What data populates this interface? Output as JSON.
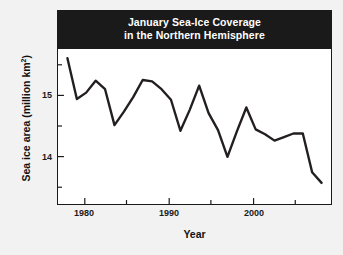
{
  "chart_data": {
    "type": "line",
    "title": "January Sea-Ice Coverage in the Northern Hemisphere",
    "title_line1": "January Sea-Ice Coverage",
    "title_line2": "in the Northern Hemisphere",
    "xlabel": "Year",
    "ylabel": "Sea ice area (million km²)",
    "ylabel_prefix": "Sea ice area (million km",
    "ylabel_sup": "2",
    "ylabel_suffix": ")",
    "grid": false,
    "legend": "none",
    "xlim": [
      1978,
      2007
    ],
    "ylim": [
      13.5,
      15.7
    ],
    "xticks": [
      1980,
      1990,
      2000
    ],
    "xtick_labels": [
      "1980",
      "1990",
      "2000"
    ],
    "xminor_ticks": [
      1985,
      1995,
      2005
    ],
    "yticks": [
      14,
      15
    ],
    "ytick_labels": [
      "14",
      "15"
    ],
    "yminor_ticks": [
      13.5,
      14.5,
      15.5
    ],
    "line_color": "#231f20",
    "line_width": 2.2,
    "x": [
      1979,
      1980,
      1981,
      1982,
      1983,
      1984,
      1985,
      1986,
      1987,
      1988,
      1989,
      1990,
      1991,
      1992,
      1993,
      1994,
      1995,
      1996,
      1997,
      1998,
      1999,
      2000,
      2001,
      2002,
      2003,
      2004,
      2005,
      2006
    ],
    "values": [
      15.57,
      14.99,
      15.08,
      15.25,
      15.13,
      14.62,
      14.81,
      15.02,
      15.26,
      15.24,
      15.13,
      14.98,
      14.54,
      14.84,
      15.18,
      14.79,
      14.55,
      14.17,
      14.53,
      14.87,
      14.56,
      14.49,
      14.4,
      14.45,
      14.5,
      14.5,
      13.95,
      13.8
    ],
    "series": [
      {
        "name": "January sea ice area",
        "values": [
          15.57,
          14.99,
          15.08,
          15.25,
          15.13,
          14.62,
          14.81,
          15.02,
          15.26,
          15.24,
          15.13,
          14.98,
          14.54,
          14.84,
          15.18,
          14.79,
          14.55,
          14.17,
          14.53,
          14.87,
          14.56,
          14.49,
          14.4,
          14.45,
          14.5,
          14.5,
          13.95,
          13.8
        ]
      }
    ]
  }
}
